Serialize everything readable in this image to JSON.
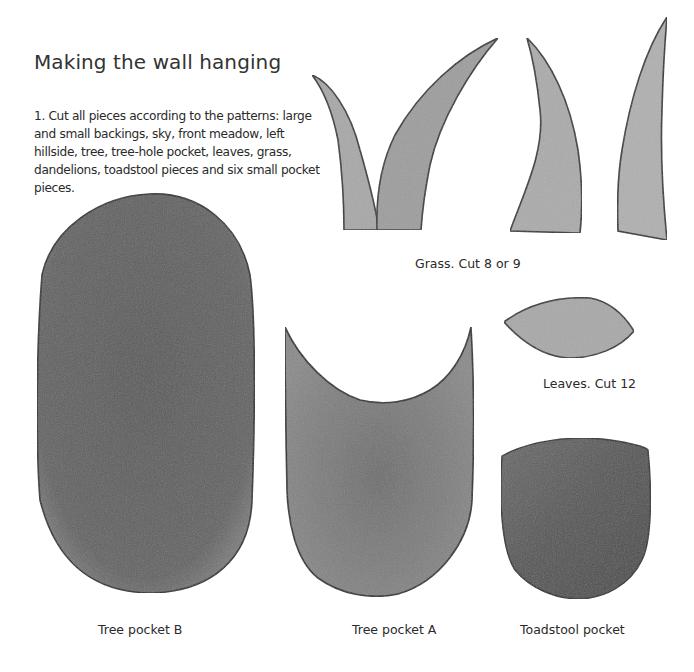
{
  "page": {
    "title": "Making the wall hanging",
    "instructions": [
      "1. Cut all pieces according to the patterns: large and small backings, sky, front meadow, left hillside, tree, tree-hole pocket, leaves, grass, dandelions, toadstool pieces and six small pocket pieces."
    ]
  },
  "patterns": [
    {
      "id": "grass",
      "caption": "Grass. Cut 8 or 9",
      "count": 4,
      "fill": "#a9a9a9"
    },
    {
      "id": "leaves",
      "caption": "Leaves. Cut 12",
      "fill": "#a8a8a8"
    },
    {
      "id": "tree-pocket-b",
      "caption": "Tree pocket B",
      "fill": "#5f5f5f"
    },
    {
      "id": "tree-pocket-a",
      "caption": "Tree pocket A",
      "fill": "#7a7a7a"
    },
    {
      "id": "toadstool-pocket",
      "caption": "Toadstool pocket",
      "fill": "#575757"
    }
  ],
  "colors": {
    "outline": "#333333",
    "grass_light": "#b0b0b0",
    "grass_dark": "#9a9a9a"
  }
}
